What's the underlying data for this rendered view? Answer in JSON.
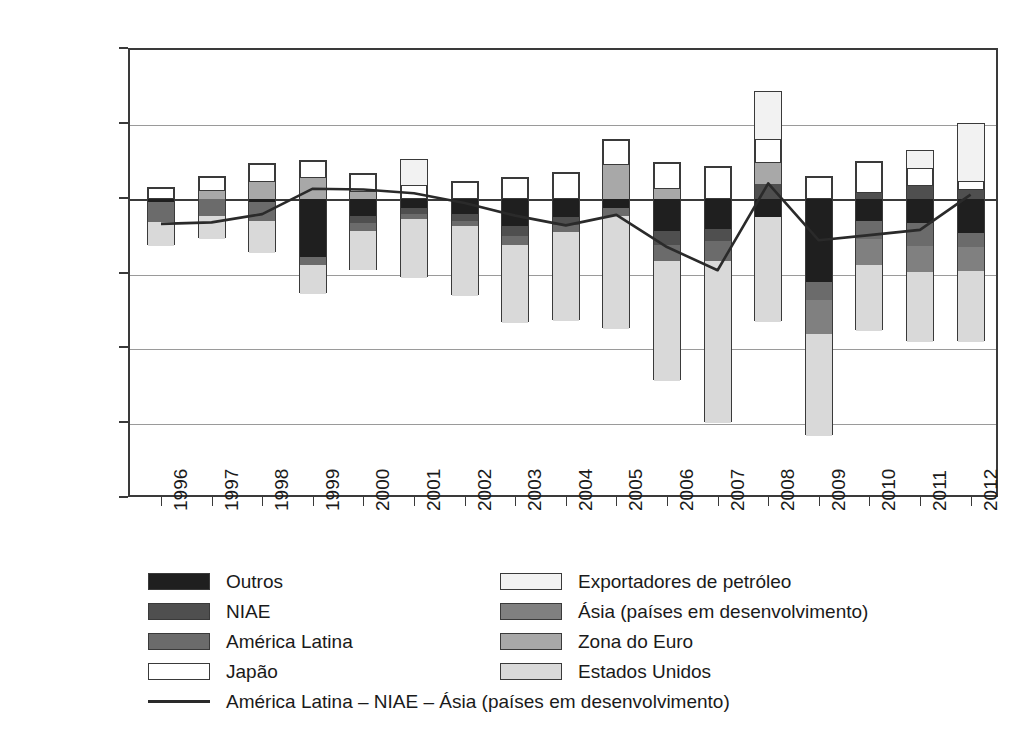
{
  "chart_data": {
    "type": "bar",
    "subtype": "stacked-bar-with-line",
    "title": "",
    "subtitle": "",
    "xlabel": "",
    "ylabel": "",
    "ylim": [
      -2000,
      1000
    ],
    "ytick_labels": [
      "1.000",
      "500",
      "0",
      "-500",
      "-1.000",
      "-1.500",
      "-2.000"
    ],
    "ytick_values": [
      1000,
      500,
      0,
      -500,
      -1000,
      -1500,
      -2000
    ],
    "grid": true,
    "legend_position": "bottom",
    "categories": [
      "1996",
      "1997",
      "1998",
      "1999",
      "2000",
      "2001",
      "2002",
      "2003",
      "2004",
      "2005",
      "2006",
      "2007",
      "2008",
      "2009",
      "2010",
      "2011",
      "2012"
    ],
    "series": [
      {
        "name": "Outros",
        "color": "#1f1f1f",
        "values": [
          -25,
          0,
          -20,
          -390,
          -115,
          -60,
          -105,
          -185,
          -125,
          -60,
          -215,
          -205,
          -120,
          -560,
          -150,
          -160,
          -230
        ]
      },
      {
        "name": "NIAE",
        "color": "#4f4f4f",
        "values": [
          0,
          0,
          0,
          0,
          -50,
          -40,
          -45,
          -65,
          -50,
          0,
          -95,
          -80,
          95,
          0,
          40,
          85,
          55
        ]
      },
      {
        "name": "América Latina",
        "color": "#6b6b6b",
        "values": [
          -130,
          -115,
          -130,
          -55,
          -50,
          -35,
          -35,
          -60,
          -45,
          -55,
          -105,
          -130,
          0,
          -115,
          -120,
          -155,
          -90
        ]
      },
      {
        "name": "Japão",
        "color": "#ffffff",
        "values": [
          70,
          95,
          120,
          115,
          120,
          90,
          110,
          135,
          170,
          165,
          170,
          210,
          160,
          145,
          205,
          120,
          60
        ]
      },
      {
        "name": "Exportadores de petróleo",
        "color": "#f2f2f2",
        "values": [
          0,
          0,
          0,
          0,
          0,
          170,
          0,
          0,
          0,
          0,
          0,
          0,
          310,
          0,
          0,
          115,
          385
        ]
      },
      {
        "name": "Ásia (países em desenvolvimento)",
        "color": "#808080",
        "values": [
          0,
          0,
          0,
          0,
          0,
          0,
          0,
          0,
          0,
          0,
          0,
          0,
          0,
          -230,
          -170,
          -175,
          -165
        ]
      },
      {
        "name": "Zona do Euro",
        "color": "#a8a8a8",
        "values": [
          0,
          50,
          110,
          140,
          45,
          0,
          0,
          0,
          0,
          225,
          65,
          0,
          145,
          0,
          0,
          0,
          0
        ]
      },
      {
        "name": "Estados Unidos",
        "color": "#d9d9d9",
        "values": [
          -160,
          -155,
          -215,
          -190,
          -265,
          -395,
          -465,
          -520,
          -595,
          -755,
          -805,
          -1085,
          -705,
          -680,
          -445,
          -470,
          -470
        ]
      }
    ],
    "line_series": {
      "name": "América Latina – NIAE – Ásia (países em desenvolvimento)",
      "color": "#2a2a2a",
      "values": [
        -175,
        -165,
        -110,
        60,
        55,
        30,
        -35,
        -120,
        -185,
        -115,
        -330,
        -485,
        95,
        -285,
        -250,
        -215,
        20
      ]
    }
  },
  "legend": {
    "rows": [
      {
        "left": {
          "label": "Outros",
          "swatch": "outros-swatch"
        },
        "right": {
          "label": "Exportadores de petróleo",
          "swatch": "exportadores-de-petroleo-swatch"
        }
      },
      {
        "left": {
          "label": "NIAE",
          "swatch": "niae-swatch"
        },
        "right": {
          "label": "Ásia (países em desenvolvimento)",
          "swatch": "asia-paises-em-desenvolvimento-swatch"
        }
      },
      {
        "left": {
          "label": "América Latina",
          "swatch": "america-latina-swatch"
        },
        "right": {
          "label": "Zona do Euro",
          "swatch": "zona-do-euro-swatch"
        }
      },
      {
        "left": {
          "label": "Japão",
          "swatch": "japao-swatch"
        },
        "right": {
          "label": "Estados Unidos",
          "swatch": "estados-unidos-swatch"
        }
      }
    ],
    "line_entry": {
      "label": "América Latina – NIAE – Ásia (países em desenvolvimento)",
      "swatch": "line-swatch"
    }
  }
}
